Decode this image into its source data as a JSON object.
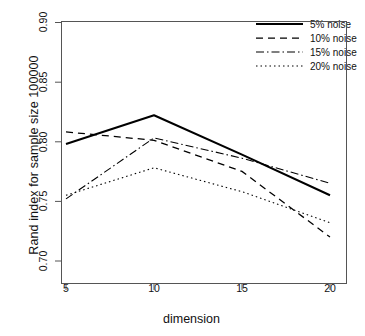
{
  "chart_data": {
    "type": "line",
    "title": "",
    "xlabel": "dimension",
    "ylabel": "Rand index for sample size 100000",
    "x": [
      5,
      10,
      15,
      20
    ],
    "xlim": [
      4,
      21
    ],
    "ylim": [
      0.695,
      0.905
    ],
    "xticks": [
      "5",
      "10",
      "15",
      "20"
    ],
    "yticks": [
      "0.70",
      "0.75",
      "0.80",
      "0.85",
      "0.90"
    ],
    "ytick_values": [
      0.7,
      0.75,
      0.8,
      0.85,
      0.9
    ],
    "grid": false,
    "legend_position": "top-right",
    "series": [
      {
        "name": "5% noise",
        "style": "solid",
        "color": "#000000",
        "values": [
          0.798,
          0.822,
          0.789,
          0.755
        ]
      },
      {
        "name": "10% noise",
        "style": "dashed",
        "color": "#000000",
        "values": [
          0.808,
          0.801,
          0.775,
          0.72
        ]
      },
      {
        "name": "15% noise",
        "style": "dashdot",
        "color": "#000000",
        "values": [
          0.752,
          0.803,
          0.786,
          0.765
        ]
      },
      {
        "name": "20% noise",
        "style": "dotted",
        "color": "#000000",
        "values": [
          0.755,
          0.778,
          0.758,
          0.732
        ]
      }
    ]
  },
  "axes": {
    "y_label": "Rand index for sample size 100000",
    "x_label": "dimension",
    "y_ticks": [
      "0.90",
      "0.85",
      "0.80",
      "0.75",
      "0.70"
    ],
    "x_ticks": [
      "5",
      "10",
      "15",
      "20"
    ]
  },
  "legend": {
    "items": [
      {
        "label": "5% noise"
      },
      {
        "label": "10% noise"
      },
      {
        "label": "15% noise"
      },
      {
        "label": "20% noise"
      }
    ]
  }
}
